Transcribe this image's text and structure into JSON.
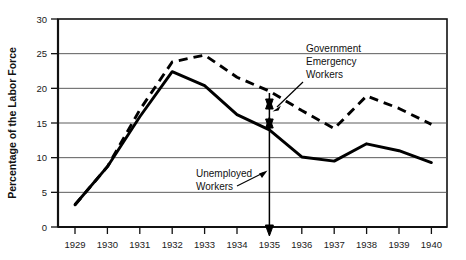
{
  "chart_data": {
    "type": "line",
    "title": "",
    "xlabel": "",
    "ylabel": "Percentage of the Labor Force",
    "x": [
      1929,
      1930,
      1931,
      1932,
      1933,
      1934,
      1935,
      1936,
      1937,
      1938,
      1939,
      1940
    ],
    "xlim": [
      1928.8,
      1940.2
    ],
    "ylim": [
      0,
      30
    ],
    "yticks": [
      0,
      5,
      10,
      15,
      20,
      25,
      30
    ],
    "xticks": [
      "1929",
      "1930",
      "1931",
      "1932",
      "1933",
      "1934",
      "1935",
      "1936",
      "1937",
      "1938",
      "1939",
      "1940"
    ],
    "grid": "horizontal",
    "legend": "none",
    "series": [
      {
        "name": "Unemployed Workers",
        "style": "solid",
        "color": "#000000",
        "values": [
          3.2,
          8.7,
          15.9,
          22.4,
          20.4,
          16.2,
          14.0,
          10.1,
          9.5,
          12.0,
          11.0,
          9.3
        ]
      },
      {
        "name": "Government Emergency Workers",
        "style": "dashed",
        "color": "#000000",
        "values": [
          3.2,
          8.7,
          16.9,
          23.8,
          24.8,
          21.6,
          19.6,
          16.8,
          14.2,
          18.9,
          17.1,
          14.8
        ]
      }
    ],
    "annotations": [
      {
        "name": "government-emergency-workers",
        "text_lines": [
          "Government",
          "Emergency",
          "Workers"
        ],
        "points_to_year": 1935,
        "points_to_value": 19.5
      },
      {
        "name": "unemployed-workers",
        "text_lines": [
          "Unemployed",
          "Workers"
        ],
        "points_to_year": 1935,
        "points_to_value": 8.0
      }
    ],
    "marker_arrow": {
      "name": "vertical-range-arrow",
      "year": 1935,
      "top_value": 19.5,
      "bottom_value": 0.0,
      "mid_value": 14.0
    }
  }
}
